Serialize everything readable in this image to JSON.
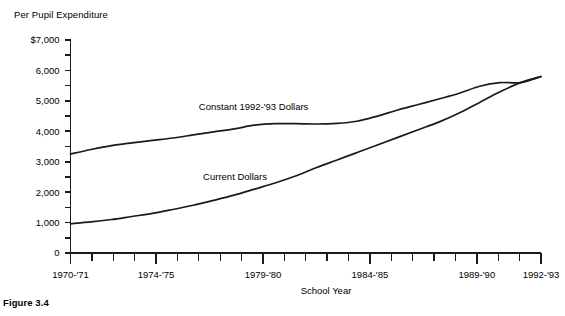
{
  "figure": {
    "caption": "Figure 3.4"
  },
  "chart_data": {
    "type": "line",
    "title": "Per Pupil Expenditure",
    "xlabel": "School Year",
    "ylabel": "",
    "ylim": [
      0,
      7000
    ],
    "xlim": [
      1970,
      1992
    ],
    "grid": false,
    "legend_position": "inline-annotation",
    "y_ticks_major": [
      "$7,000",
      "6,000",
      "5,000",
      "4,000",
      "3,000",
      "2,000",
      "1,000",
      "0"
    ],
    "y_tick_values_major": [
      7000,
      6000,
      5000,
      4000,
      3000,
      2000,
      1000,
      0
    ],
    "y_tick_values_minor": [
      6500,
      5500,
      4500,
      3500,
      2500,
      1500,
      500
    ],
    "x_tick_labels": [
      "1970-'71",
      "1974-'75",
      "1979-'80",
      "1984-'85",
      "1989-'90",
      "1992-'93"
    ],
    "x_tick_label_years": [
      1970,
      1974,
      1979,
      1984,
      1989,
      1992
    ],
    "x_all_years": [
      1970,
      1971,
      1972,
      1973,
      1974,
      1975,
      1976,
      1977,
      1978,
      1979,
      1980,
      1981,
      1982,
      1983,
      1984,
      1985,
      1986,
      1987,
      1988,
      1989,
      1990,
      1991,
      1992
    ],
    "series": [
      {
        "name": "Constant 1992-'93 Dollars",
        "label_x_year": 1976.0,
        "label_y_value": 4700,
        "values": [
          3250,
          3400,
          3530,
          3620,
          3700,
          3780,
          3880,
          3980,
          4080,
          4200,
          4250,
          4250,
          4240,
          4260,
          4330,
          4500,
          4700,
          4880,
          5060,
          5250,
          5480,
          5600,
          5600,
          5800
        ]
      },
      {
        "name": "Current Dollars",
        "label_x_year": 1976.2,
        "label_y_value": 2400,
        "values": [
          960,
          1020,
          1100,
          1200,
          1300,
          1430,
          1570,
          1730,
          1900,
          2100,
          2300,
          2530,
          2800,
          3050,
          3300,
          3550,
          3800,
          4050,
          4300,
          4600,
          4950,
          5300,
          5600,
          5800
        ]
      }
    ]
  }
}
